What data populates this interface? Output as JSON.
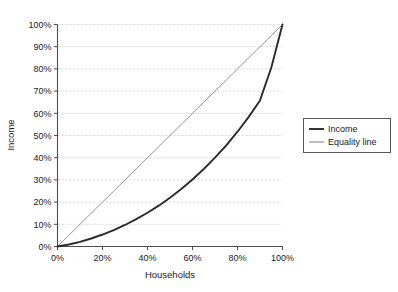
{
  "chart_data": {
    "type": "line",
    "title": "",
    "xlabel": "Households",
    "ylabel": "Income",
    "xlim": [
      0,
      100
    ],
    "ylim": [
      0,
      100
    ],
    "grid": "horizontal-dashed",
    "legend_position": "right",
    "x_ticks": [
      "0%",
      "20%",
      "40%",
      "60%",
      "80%",
      "100%"
    ],
    "x_tick_values": [
      0,
      20,
      40,
      60,
      80,
      100
    ],
    "y_ticks": [
      "0%",
      "10%",
      "20%",
      "30%",
      "40%",
      "50%",
      "60%",
      "70%",
      "80%",
      "90%",
      "100%"
    ],
    "y_tick_values": [
      0,
      10,
      20,
      30,
      40,
      50,
      60,
      70,
      80,
      90,
      100
    ],
    "x": [
      0,
      5,
      10,
      15,
      20,
      25,
      30,
      35,
      40,
      45,
      50,
      55,
      60,
      65,
      70,
      75,
      80,
      85,
      90,
      95,
      100
    ],
    "series": [
      {
        "name": "Income",
        "color": "#2b2b2b",
        "width": 1.9,
        "values": [
          0,
          0.9,
          2.1,
          3.6,
          5.4,
          7.4,
          9.7,
          12.3,
          15.2,
          18.4,
          22.0,
          25.9,
          30.2,
          34.9,
          40.0,
          45.6,
          51.7,
          58.4,
          65.8,
          80.5,
          100
        ]
      },
      {
        "name": "Equality line",
        "color": "#6f6f6f",
        "width": 0.75,
        "values": [
          0,
          5,
          10,
          15,
          20,
          25,
          30,
          35,
          40,
          45,
          50,
          55,
          60,
          65,
          70,
          75,
          80,
          85,
          90,
          95,
          100
        ]
      }
    ],
    "colors": {
      "income_line": "#2b2b2b",
      "equality_line": "#6f6f6f",
      "axis": "#4d4d4d",
      "gridline": "#c9c9d6",
      "legend_border": "#5a5a5a",
      "background": "#ffffff"
    }
  },
  "legend": {
    "items": [
      {
        "label": "Income"
      },
      {
        "label": "Equality line"
      }
    ]
  }
}
